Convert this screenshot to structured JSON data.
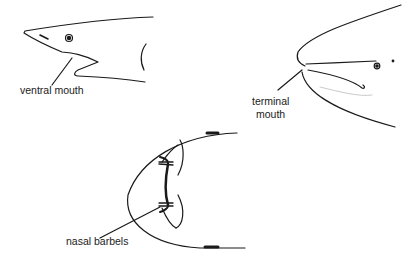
{
  "figure": {
    "panels": [
      {
        "id": "ventral",
        "label": "ventral mouth"
      },
      {
        "id": "terminal",
        "label_line1": "terminal",
        "label_line2": "mouth"
      },
      {
        "id": "barbels",
        "label": "nasal barbels"
      }
    ],
    "colors": {
      "ink": "#1a1a1a",
      "background": "#ffffff"
    }
  }
}
